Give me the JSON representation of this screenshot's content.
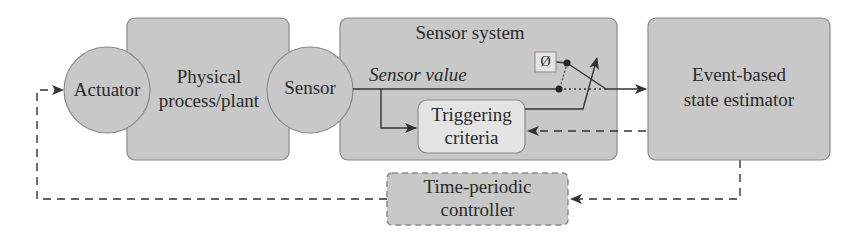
{
  "diagram": {
    "type": "block-diagram",
    "colors": {
      "block_fill": "#c8c8c8",
      "block_stroke": "#8a8a8a",
      "inner_fill": "#e4e4e4",
      "line": "#333333",
      "background": "#ffffff"
    },
    "nodes": {
      "actuator": {
        "label": "Actuator",
        "shape": "circle"
      },
      "plant": {
        "label_line1": "Physical",
        "label_line2": "process/plant",
        "shape": "rounded-rect"
      },
      "sensor": {
        "label": "Sensor",
        "shape": "circle"
      },
      "sensor_system": {
        "label": "Sensor system",
        "shape": "rounded-rect"
      },
      "sensor_value": {
        "label": "Sensor value",
        "style": "italic"
      },
      "empty_set": {
        "label": "Ø",
        "shape": "square"
      },
      "triggering": {
        "label_line1": "Triggering",
        "label_line2": "criteria",
        "shape": "rounded-rect"
      },
      "estimator": {
        "label_line1": "Event-based",
        "label_line2": "state estimator",
        "shape": "rounded-rect"
      },
      "controller": {
        "label_line1": "Time-periodic",
        "label_line2": "controller",
        "shape": "rounded-rect-dashed"
      }
    },
    "edges": [
      {
        "from": "sensor",
        "to": "estimator",
        "style": "solid",
        "via": "switch"
      },
      {
        "from": "sensor_value",
        "to": "triggering",
        "style": "solid"
      },
      {
        "from": "triggering",
        "to": "switch",
        "style": "solid"
      },
      {
        "from": "estimator",
        "to": "triggering",
        "style": "dashed"
      },
      {
        "from": "estimator",
        "to": "controller",
        "style": "dashed"
      },
      {
        "from": "controller",
        "to": "actuator",
        "style": "dashed"
      }
    ]
  }
}
